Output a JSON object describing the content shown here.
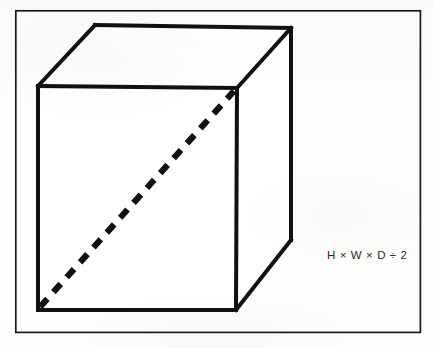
{
  "figure": {
    "name": "box-volume-diagram",
    "background_color": "#fdfdfb",
    "ink_color": "#111111",
    "border": {
      "name": "figure-border",
      "x": 15,
      "y": 10,
      "width": 406,
      "height": 323,
      "stroke_width": 1.6,
      "color": "#1a1a1a"
    },
    "box": {
      "stroke_width": 4,
      "color": "#111111",
      "vertices": {
        "front_top_left": [
          38,
          86
        ],
        "front_top_right": [
          237,
          88
        ],
        "front_bottom_right": [
          236,
          310
        ],
        "front_bottom_left": [
          38,
          310
        ],
        "back_top_left": [
          95,
          25
        ],
        "back_top_right": [
          291,
          28
        ],
        "back_bottom_right": [
          291,
          240
        ]
      },
      "faces": [
        {
          "name": "front-face",
          "points": "38,86 237,88 236,310 38,310"
        },
        {
          "name": "top-face",
          "points": "38,86 95,25 291,28 237,88"
        },
        {
          "name": "right-face",
          "points": "237,88 291,28 291,240 236,310"
        }
      ]
    },
    "diagonal": {
      "name": "front-face-diagonal",
      "style": "dashed",
      "from": [
        40,
        307
      ],
      "to": [
        234,
        91
      ],
      "stroke_width": 6,
      "dash": "11 9",
      "color": "#111111"
    }
  },
  "annotations": {
    "formula": {
      "name": "volume-formula",
      "text": "H × W × D ÷ 2",
      "x": 327,
      "y": 249,
      "font_size": 11.5,
      "color": "#2b2b2b"
    }
  }
}
